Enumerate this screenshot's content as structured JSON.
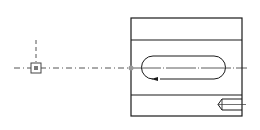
{
  "drawing": {
    "type": "cad-sketch",
    "colors": {
      "line": "#1a1a1a",
      "construction": "#555555",
      "point": "#888888",
      "background": "#ffffff"
    },
    "reference_point": {
      "x": 36,
      "y": 68,
      "size": 9
    },
    "vertical_construction_line": {
      "x": 36,
      "y1": 40,
      "y2": 62
    },
    "horizontal_construction_line": {
      "x1": 14,
      "x2": 245,
      "y": 68
    },
    "body_rect": {
      "x": 131,
      "y": 18,
      "width": 111,
      "height": 98
    },
    "inner_lines": [
      40,
      95
    ],
    "slot": {
      "x1": 142,
      "x2": 225,
      "y1": 56,
      "y2": 79
    },
    "midpoint_marker": {
      "x": 131,
      "y": 68
    },
    "hole_feature": {
      "x1": 218,
      "x2": 242,
      "y1": 99,
      "y2": 110
    }
  }
}
